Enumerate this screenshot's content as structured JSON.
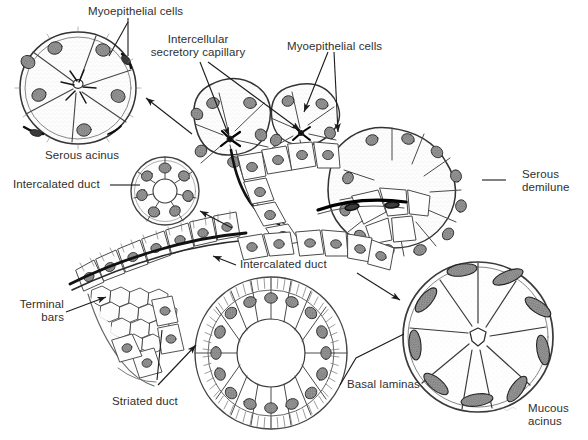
{
  "figure": {
    "background_color": "#ffffff",
    "ink_color": "#2f2f2f",
    "line_color": "#1a1a1a",
    "cell_fill": "#fbfbfb",
    "nucleus_fill": "#8a8a8a",
    "signature": "Bangham"
  },
  "labels": [
    {
      "id": "myoepithelial-cells-left",
      "text": "Myoepithelial cells",
      "lines": [
        "Myoepithelial cells"
      ]
    },
    {
      "id": "intercellular-secretory-capillary",
      "text": "Intercellular secretory capillary",
      "lines": [
        "Intercellular",
        "secretory capillary"
      ]
    },
    {
      "id": "myoepithelial-cells-right",
      "text": "Myoepithelial cells",
      "lines": [
        "Myoepithelial cells"
      ]
    },
    {
      "id": "serous-acinus",
      "text": "Serous acinus",
      "lines": [
        "Serous acinus"
      ]
    },
    {
      "id": "intercalated-duct-left",
      "text": "Intercalated duct",
      "lines": [
        "Intercalated duct"
      ]
    },
    {
      "id": "serous-demilune",
      "text": "Serous demilune",
      "lines": [
        "Serous",
        "demilune"
      ]
    },
    {
      "id": "intercalated-duct-center",
      "text": "Intercalated duct",
      "lines": [
        "Intercalated duct"
      ]
    },
    {
      "id": "terminal-bars",
      "text": "Terminal bars",
      "lines": [
        "Terminal",
        "bars"
      ]
    },
    {
      "id": "striated-duct",
      "text": "Striated duct",
      "lines": [
        "Striated duct"
      ]
    },
    {
      "id": "basal-laminas",
      "text": "Basal laminas",
      "lines": [
        "Basal laminas"
      ]
    },
    {
      "id": "mucous-acinus",
      "text": "Mucous acinus",
      "lines": [
        "Mucous",
        "acinus"
      ]
    }
  ],
  "structures": [
    {
      "id": "serous-acinus-inset",
      "name": "Serous acinus cross-section",
      "cell_count": 6
    },
    {
      "id": "intercalated-duct-inset",
      "name": "Intercalated duct cross-section",
      "cell_count": 7
    },
    {
      "id": "striated-duct-inset",
      "name": "Striated duct cross-section",
      "cell_count": 16
    },
    {
      "id": "mucous-acinus-inset",
      "name": "Mucous acinus cross-section",
      "cell_count": 8
    },
    {
      "id": "central-secretory-unit",
      "name": "Intact secretory unit with acini and ducts",
      "cell_count": 0
    }
  ]
}
